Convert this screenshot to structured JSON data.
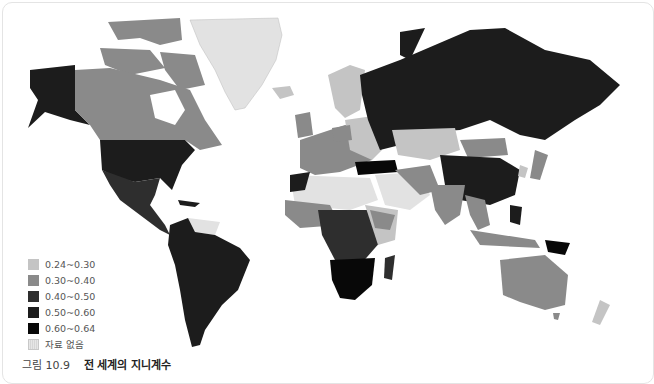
{
  "map": {
    "title": "전 세계의 지니계수",
    "figure_label": "그림 10.9",
    "colors": {
      "c1": "#c4c4c4",
      "c2": "#8a8a8a",
      "c3": "#2e2e2e",
      "c4": "#1c1c1c",
      "c5": "#080808",
      "nodata": "#e2e2e2",
      "water": "#ffffff"
    }
  },
  "legend": {
    "items": [
      {
        "label": "0.24~0.30",
        "color": "#c4c4c4"
      },
      {
        "label": "0.30~0.40",
        "color": "#8a8a8a"
      },
      {
        "label": "0.40~0.50",
        "color": "#2e2e2e"
      },
      {
        "label": "0.50~0.60",
        "color": "#1c1c1c"
      },
      {
        "label": "0.60~0.64",
        "color": "#080808"
      },
      {
        "label": "자료 없음",
        "color": "#e2e2e2"
      }
    ]
  },
  "caption": {
    "figure_label": "그림 10.9",
    "title": "전 세계의 지니계수"
  }
}
